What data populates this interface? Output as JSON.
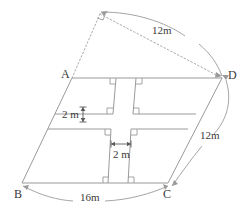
{
  "diagram": {
    "type": "geometry-figure",
    "stroke_color": "#9a9a9a",
    "dotted_color": "#aaaaaa",
    "text_color": "#3a3a3a",
    "background": "#ffffff",
    "vertices": [
      {
        "name": "A",
        "label": "A",
        "x": 72,
        "y": 78
      },
      {
        "name": "B",
        "label": "B",
        "x": 22,
        "y": 183
      },
      {
        "name": "C",
        "label": "C",
        "x": 168,
        "y": 183
      },
      {
        "name": "D",
        "label": "D",
        "x": 222,
        "y": 78
      },
      {
        "name": "E",
        "label": "",
        "x": 100,
        "y": 14
      }
    ],
    "vertex_labels": [
      {
        "name": "label-A",
        "text": "A",
        "x": 61,
        "y": 68
      },
      {
        "name": "label-B",
        "text": "B",
        "x": 14,
        "y": 188
      },
      {
        "name": "label-C",
        "text": "C",
        "x": 163,
        "y": 188
      },
      {
        "name": "label-D",
        "text": "D",
        "x": 228,
        "y": 69
      }
    ],
    "dimensions": [
      {
        "name": "dim-top-12m",
        "text": "12m",
        "x": 152,
        "y": 25,
        "measures": "E-to-D dotted segment"
      },
      {
        "name": "dim-right-12m",
        "text": "12m",
        "x": 200,
        "y": 130,
        "measures": "D-to-C side"
      },
      {
        "name": "dim-bottom-16m",
        "text": "16m",
        "x": 80,
        "y": 192,
        "measures": "B-to-C side"
      },
      {
        "name": "dim-path-width-vertical",
        "text": "2 m",
        "x": 62,
        "y": 113,
        "measures": "horizontal path width"
      },
      {
        "name": "dim-path-width-horizontal",
        "text": "2 m",
        "x": 119,
        "y": 153,
        "measures": "vertical path width"
      }
    ],
    "right_angle_marks": 9,
    "notes": {
      "cross_paths": "two 2 m wide paths crossing the parallelogram",
      "apex_right_angle": "right angle mark at apex E"
    }
  }
}
